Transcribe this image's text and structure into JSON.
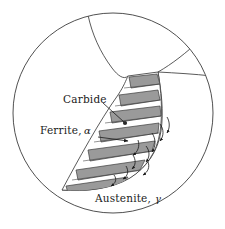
{
  "figure": {
    "type": "microstructure-schematic",
    "background_color": "#ffffff",
    "outline_color": "#3c3c3c",
    "carbide_fill": "#9a9a9a",
    "ferrite_fill": "#ffffff",
    "austenite_fill": "#ffffff",
    "arrow_color": "#1a1a1a"
  },
  "labels": {
    "carbide": {
      "text": "Carbide",
      "x": 63,
      "y": 100,
      "leader_to_x": 115,
      "leader_to_y": 123
    },
    "ferrite": {
      "text": "Ferrite,",
      "symbol": "α",
      "x": 40,
      "y": 132,
      "symbol_x": 84,
      "symbol_y": 132,
      "arrow_to_x": 130,
      "arrow_to_y": 140
    },
    "austenite": {
      "text": "Austenite,",
      "symbol": "γ",
      "x": 95,
      "y": 201,
      "symbol_x": 155,
      "symbol_y": 201
    }
  },
  "geometry": {
    "circle": {
      "cx": 113,
      "cy": 113,
      "r": 100
    },
    "grain_boundaries": [
      "top-left boundary descending from top of circle to colony apex",
      "right boundary from triple point to circle edge",
      "upper-right boundary from triple point to circle top-right"
    ],
    "colony": {
      "apex_bottom_x": 62,
      "apex_bottom_y": 190,
      "top_left_x": 128,
      "top_left_y": 76,
      "top_right_x": 158,
      "top_right_y": 72,
      "lamellae_count": 7
    },
    "diffusion_arrows_count": 9
  },
  "legend": {
    "carbide_description": "dark gray lamellae",
    "ferrite_description": "white lamellae",
    "austenite_description": "untransformed parent grain"
  }
}
